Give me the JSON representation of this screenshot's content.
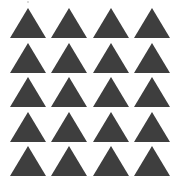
{
  "figure": {
    "rows": 5,
    "columns": 4,
    "total_shapes": 20,
    "shape": "triangle-up",
    "fill_color": "#3e3e3e",
    "background_color": "#ffffff"
  }
}
